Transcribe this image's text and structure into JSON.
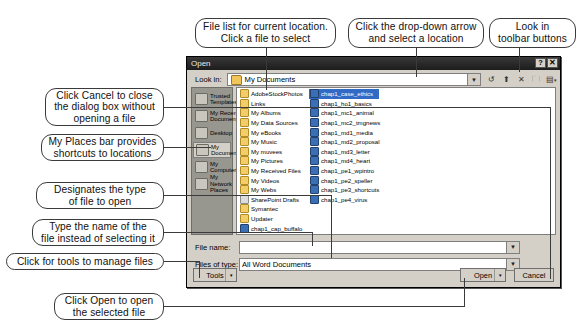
{
  "callouts": {
    "file_list": "File list for current location.\nClick a file to select",
    "dropdown": "Click the drop-down arrow\nand select a location",
    "toolbar": "Look in\ntoolbar buttons",
    "cancel": "Click Cancel to close\nthe dialog box without\nopening a file",
    "places": "My Places bar provides\nshortcuts to locations",
    "filetype": "Designates the type\nof file to open",
    "filename": "Type the name of the\nfile instead of selecting it",
    "tools": "Click for tools to manage files",
    "open": "Click Open to open\nthe selected file"
  },
  "dialog": {
    "title": "Open",
    "help_button": "?",
    "close_button": "✕",
    "look_in_label": "Look in:",
    "look_in_value": "My Documents",
    "toolbar_icons": [
      "back-icon",
      "up-one-level-icon",
      "delete-icon",
      "new-folder-icon",
      "views-icon"
    ],
    "places": [
      {
        "label": "Trusted\nTemplates",
        "icon": "trusted-templates-icon",
        "selected": false
      },
      {
        "label": "My Recent\nDocuments",
        "icon": "recent-documents-icon",
        "selected": false
      },
      {
        "label": "Desktop",
        "icon": "desktop-icon",
        "selected": false
      },
      {
        "label": "My\nDocuments",
        "icon": "my-documents-icon",
        "selected": true
      },
      {
        "label": "My\nComputer",
        "icon": "my-computer-icon",
        "selected": false
      },
      {
        "label": "My Network\nPlaces",
        "icon": "network-places-icon",
        "selected": false
      }
    ],
    "files_col1": [
      {
        "name": "AdobeStockPhotos",
        "type": "folder",
        "selected": false
      },
      {
        "name": "Links",
        "type": "folder",
        "selected": false
      },
      {
        "name": "My Albums",
        "type": "folder",
        "selected": false
      },
      {
        "name": "My Data Sources",
        "type": "folder",
        "selected": false
      },
      {
        "name": "My eBooks",
        "type": "folder",
        "selected": false
      },
      {
        "name": "My Music",
        "type": "folder",
        "selected": false
      },
      {
        "name": "My muvees",
        "type": "folder",
        "selected": false
      },
      {
        "name": "My Pictures",
        "type": "folder",
        "selected": false
      },
      {
        "name": "My Received Files",
        "type": "folder",
        "selected": false
      },
      {
        "name": "My Videos",
        "type": "folder",
        "selected": false
      },
      {
        "name": "My Webs",
        "type": "folder",
        "selected": false
      },
      {
        "name": "SharePoint Drafts",
        "type": "sharepoint",
        "selected": false
      },
      {
        "name": "Symantec",
        "type": "folder",
        "selected": false
      },
      {
        "name": "Updater",
        "type": "folder",
        "selected": false
      },
      {
        "name": "chap1_cap_buffalo",
        "type": "word",
        "selected": false
      },
      {
        "name": "chap1_case_ethics",
        "type": "word",
        "selected": true
      },
      {
        "name": "chap1_ho1_basics",
        "type": "word",
        "selected": false
      },
      {
        "name": "chap1_mc1_animal",
        "type": "word",
        "selected": false
      }
    ],
    "files_col2": [
      {
        "name": "chap1_mc2_tmgnews",
        "type": "word",
        "selected": false
      },
      {
        "name": "chap1_md1_media",
        "type": "word",
        "selected": false
      },
      {
        "name": "chap1_md2_proposal",
        "type": "word",
        "selected": false
      },
      {
        "name": "chap1_md3_letter",
        "type": "word",
        "selected": false
      },
      {
        "name": "chap1_md4_heart",
        "type": "word",
        "selected": false
      },
      {
        "name": "chap1_pe1_wpintro",
        "type": "word",
        "selected": false
      },
      {
        "name": "chap1_pe2_speller",
        "type": "word",
        "selected": false
      },
      {
        "name": "chap1_pe3_shortcuts",
        "type": "word",
        "selected": false
      },
      {
        "name": "chap1_pe4_virus",
        "type": "word",
        "selected": false
      }
    ],
    "file_name_label": "File name:",
    "file_name_value": "",
    "files_of_type_label": "Files of type:",
    "files_of_type_value": "All Word Documents",
    "tools_button": "Tools",
    "open_button": "Open",
    "cancel_button": "Cancel"
  },
  "colors": {
    "titlebar": "#2b2b2b",
    "dialog_face": "#d4d0c8",
    "places_bar": "#97968f",
    "selection": "#316ac5",
    "callout_border": "#3b3b3b"
  }
}
